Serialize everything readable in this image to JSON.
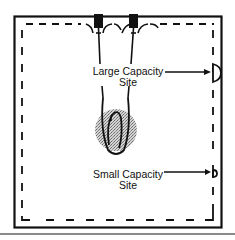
{
  "diagram": {
    "type": "site-layout",
    "labels": {
      "large_site_line1": "Large Capacity",
      "large_site_line2": "Site",
      "small_site_line1": "Small Capacity",
      "small_site_line2": "Site"
    },
    "elements": {
      "outer_boundary": "solid-rectangle",
      "inner_boundary": "dashed-rectangle",
      "connectors": [
        "block-connector",
        "block-connector"
      ],
      "center_feature": "shaded-circle-with-loop",
      "large_site_marker": "half-circle-marker",
      "small_site_marker": "small-b-marker"
    },
    "colors": {
      "ink": "#111111",
      "shade": "#9a9a9a",
      "bottom_rule": "#8a8a8a"
    }
  }
}
